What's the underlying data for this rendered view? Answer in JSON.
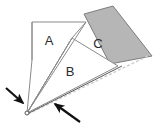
{
  "figure": {
    "canvas": {
      "width": 164,
      "height": 125,
      "background": "#ffffff"
    },
    "colors": {
      "background": "#ffffff",
      "region_a_fill": "#ffffff",
      "region_b_fill": "#ffffff",
      "region_c_fill": "#b6b6b6",
      "outline": "#8a8a8a",
      "outline_dark": "#5a5a5a",
      "label_text": "#2b2b2b",
      "arrow": "#111111",
      "dashed_line": "#cccccc"
    },
    "labels": [
      {
        "id": "label-a",
        "text": "A",
        "x": 49,
        "y": 45
      },
      {
        "id": "label-b",
        "text": "B",
        "x": 70,
        "y": 76
      },
      {
        "id": "label-c",
        "text": "C",
        "x": 98,
        "y": 48
      }
    ],
    "regions": [
      {
        "id": "region-a",
        "name": "region-a-quadrilateral",
        "label": "A",
        "fill": "#ffffff",
        "stroke": "#8a8a8a",
        "points": "32,22 86,22 72,38 27,113 32,60"
      },
      {
        "id": "region-b",
        "name": "region-b-triangle",
        "label": "B",
        "fill": "#ffffff",
        "stroke": "#8a8a8a",
        "points": "72,38 118,66 27,113"
      },
      {
        "id": "region-c",
        "name": "region-c-shaded-quadrilateral",
        "label": "C",
        "fill": "#b6b6b6",
        "stroke": "#7d7d7d",
        "points": "84,14 113,6 152,56 110,64"
      }
    ],
    "lines": [
      {
        "id": "edge-apex-to-a-top",
        "name": "edge-apex-to-top-right",
        "x1": 27,
        "y1": 113,
        "x2": 86,
        "y2": 22,
        "stroke": "#8a8a8a",
        "dashed": false
      },
      {
        "id": "edge-apex-to-b-apex",
        "name": "edge-apex-to-b-apex",
        "x1": 27,
        "y1": 113,
        "x2": 72,
        "y2": 38,
        "stroke": "#8a8a8a",
        "dashed": false
      },
      {
        "id": "edge-apex-to-c-right",
        "name": "edge-apex-to-far-right",
        "x1": 28,
        "y1": 114,
        "x2": 150,
        "y2": 55,
        "stroke": "#cccccc",
        "dashed": true
      },
      {
        "id": "edge-apex-lower",
        "name": "edge-apex-lower-diagonal",
        "x1": 27,
        "y1": 114,
        "x2": 120,
        "y2": 67,
        "stroke": "#5a5a5a",
        "dashed": false
      }
    ],
    "arrows": [
      {
        "id": "arrow-upper-left",
        "name": "arrow-pointer-upper-left",
        "x1": 6,
        "y1": 88,
        "x2": 25,
        "y2": 105,
        "color": "#111111"
      },
      {
        "id": "arrow-lower-right",
        "name": "arrow-pointer-lower-right",
        "x1": 80,
        "y1": 122,
        "x2": 53,
        "y2": 103,
        "color": "#111111"
      }
    ],
    "apex": {
      "id": "apex-vertex",
      "x": 27,
      "y": 113
    }
  }
}
